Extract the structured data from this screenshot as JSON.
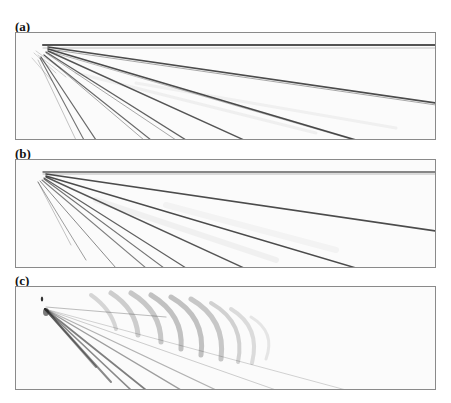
{
  "figure": {
    "caption_clipped": "",
    "panels": [
      {
        "label": "(a)",
        "description": "Ray-fan wavefield snapshot: horizontal reflector trace with straight rays fanning from a near-surface source"
      },
      {
        "label": "(b)",
        "description": "Ray-fan wavefield snapshot with weaker background noise and a horizontal trace"
      },
      {
        "label": "(c)",
        "description": "Wavefield snapshot with diverging rays and curved feather-like arcs to the upper right"
      }
    ]
  },
  "colors": {
    "ink": "#2a2a2a",
    "frame": "#8a8a8a",
    "background": "#ffffff"
  }
}
